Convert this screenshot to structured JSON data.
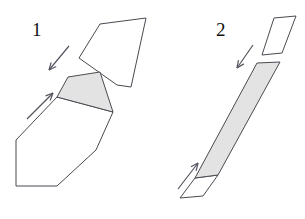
{
  "canvas": {
    "width": 305,
    "height": 219,
    "background": "#ffffff",
    "stroke_color": "#4a4a52",
    "stroke_width": 1,
    "shade_fill": "#e3e3e3",
    "blank_fill": "#ffffff",
    "arrow_color": "#555560"
  },
  "figures": [
    {
      "id": "figure-1",
      "label": "1",
      "label_position": {
        "x": 32,
        "y": 20
      },
      "description": "Angled block split along an oblique cut, upper piece displaced up-right, shaded cut face on lower piece, arrows show separation directions",
      "shapes": [
        {
          "name": "upper-piece",
          "fill": "blank",
          "points": "100,24 146,18 131,87 117,85 79,58"
        },
        {
          "name": "cut-face-shaded",
          "fill": "shade",
          "points": "68,77 100,72 113,112 57,97"
        },
        {
          "name": "lower-body",
          "fill": "blank",
          "points": "57,97 113,112 96,150 57,186 16,186 16,140"
        }
      ],
      "arrows": [
        {
          "name": "arrow-down-left",
          "from": {
            "x": 69,
            "y": 46
          },
          "to": {
            "x": 49,
            "y": 70
          },
          "direction": "down-left"
        },
        {
          "name": "arrow-up-right",
          "from": {
            "x": 27,
            "y": 119
          },
          "to": {
            "x": 53,
            "y": 93
          },
          "direction": "up-right"
        }
      ]
    },
    {
      "id": "figure-2",
      "label": "2",
      "label_position": {
        "x": 216,
        "y": 20
      },
      "description": "Thin slab split along a transverse cut, small upper slab displaced up-right, long shaded slab below, arrows show separation directions",
      "shapes": [
        {
          "name": "upper-slab",
          "fill": "blank",
          "points": "274,18 296,16 282,53 262,55"
        },
        {
          "name": "main-slab-shaded",
          "fill": "shade",
          "points": "257,63 280,62 218,175 195,178"
        },
        {
          "name": "lower-end-face",
          "fill": "blank",
          "points": "195,178 218,175 203,196 180,198"
        }
      ],
      "arrows": [
        {
          "name": "arrow-down-left",
          "from": {
            "x": 253,
            "y": 45
          },
          "to": {
            "x": 237,
            "y": 68
          },
          "direction": "down-left"
        },
        {
          "name": "arrow-up-right",
          "from": {
            "x": 178,
            "y": 189
          },
          "to": {
            "x": 198,
            "y": 163
          },
          "direction": "up-right"
        }
      ]
    }
  ]
}
